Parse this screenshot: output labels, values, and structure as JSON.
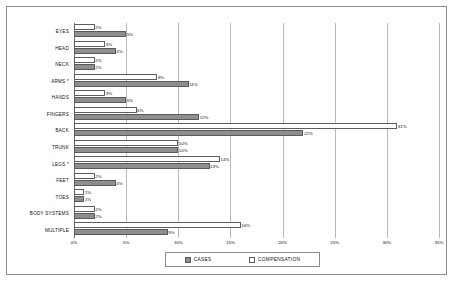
{
  "chart_data": {
    "type": "bar",
    "orientation": "horizontal",
    "title": "",
    "xlabel": "",
    "ylabel": "",
    "xlim": [
      0,
      35
    ],
    "xtick_labels": [
      "0%",
      "5%",
      "10%",
      "15%",
      "20%",
      "25%",
      "30%",
      "35%"
    ],
    "xticks": [
      0,
      5,
      10,
      15,
      20,
      25,
      30,
      35
    ],
    "grid": true,
    "legend_position": "bottom",
    "categories": [
      "EYES",
      "HEAD",
      "NECK",
      "ARMS *",
      "HANDS",
      "FINGERS",
      "BACK",
      "TRUNK",
      "LEGS *",
      "FEET",
      "TOES",
      "BODY SYSTEMS",
      "MULTIPLE"
    ],
    "series": [
      {
        "name": "COMPENSATION",
        "values": [
          2,
          3,
          2,
          8,
          3,
          6,
          31,
          10,
          14,
          2,
          1,
          2,
          16
        ],
        "labels": [
          "2%",
          "3%",
          "2%",
          "8%",
          "3%",
          "6%",
          "31%",
          "10%",
          "14%",
          "2%",
          "1%",
          "2%",
          "16%"
        ],
        "color": "#ffffff",
        "border_color": "#5d5d5d"
      },
      {
        "name": "CASES",
        "values": [
          5,
          4,
          2,
          11,
          5,
          12,
          22,
          10,
          13,
          4,
          1,
          2,
          9
        ],
        "labels": [
          "5%",
          "4%",
          "2%",
          "11%",
          "5%",
          "12%",
          "22%",
          "10%",
          "13%",
          "4%",
          "1%",
          "2%",
          "9%"
        ],
        "color": "#8e8e8e",
        "border_color": "#5a5a5a"
      }
    ]
  },
  "legend": {
    "entries": [
      {
        "label": "CASES",
        "swatch": "cases"
      },
      {
        "label": "COMPENSATION",
        "swatch": "comp"
      }
    ]
  }
}
